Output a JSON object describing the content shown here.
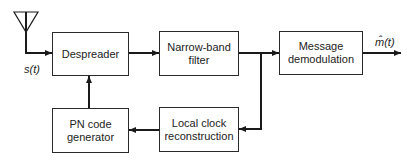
{
  "diagram": {
    "input_signal": "s(t)",
    "output_signal": "m̂(t)",
    "blocks": [
      {
        "id": "despreader",
        "label": "Despreader",
        "x": 52,
        "y": 32,
        "w": 77,
        "h": 44
      },
      {
        "id": "narrowband-filter",
        "label": "Narrow-band\nfilter",
        "x": 159,
        "y": 31,
        "w": 80,
        "h": 45
      },
      {
        "id": "message-demodulation",
        "label": "Message\ndemodulation",
        "x": 279,
        "y": 31,
        "w": 84,
        "h": 44
      },
      {
        "id": "pn-code-generator",
        "label": "PN code\ngenerator",
        "x": 52,
        "y": 108,
        "w": 77,
        "h": 45
      },
      {
        "id": "local-clock-reconstruction",
        "label": "Local clock\nreconstruction",
        "x": 159,
        "y": 107,
        "w": 80,
        "h": 45
      }
    ],
    "connections": [
      {
        "from": "antenna",
        "to": "despreader",
        "label": "s(t)"
      },
      {
        "from": "despreader",
        "to": "narrowband-filter"
      },
      {
        "from": "narrowband-filter",
        "to": "message-demodulation"
      },
      {
        "from": "narrowband-filter",
        "to": "local-clock-reconstruction"
      },
      {
        "from": "local-clock-reconstruction",
        "to": "pn-code-generator"
      },
      {
        "from": "pn-code-generator",
        "to": "despreader"
      },
      {
        "from": "message-demodulation",
        "to": "output",
        "label": "m̂(t)"
      }
    ],
    "colors": {
      "line": "#1a1a1a",
      "background": "#ffffff"
    }
  }
}
